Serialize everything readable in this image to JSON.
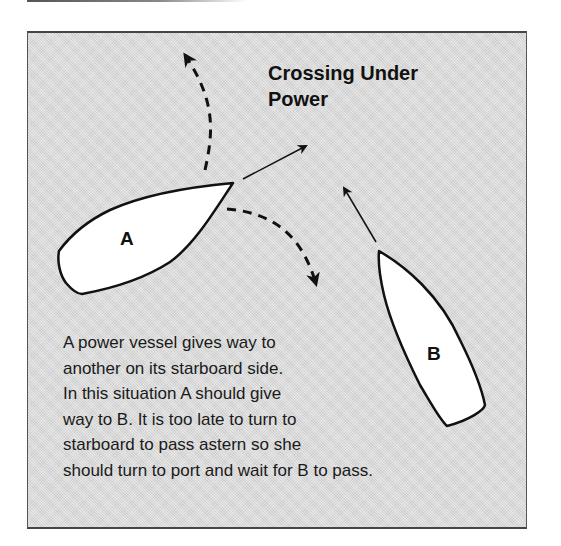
{
  "diagram": {
    "title_lines": [
      "Crossing Under",
      "Power"
    ],
    "caption_lines": [
      "A power vessel gives way to",
      "another on its starboard side.",
      "In this situation A should give",
      "way to B. It is too late to turn to",
      "starboard to pass astern so she",
      "should turn to port and wait for B to pass."
    ],
    "vessels": [
      {
        "id": "A",
        "label": "A",
        "heading": "north-east",
        "role": "give-way vessel"
      },
      {
        "id": "B",
        "label": "B",
        "heading": "north-west",
        "role": "stand-on vessel"
      }
    ],
    "arrows": [
      {
        "from": "A",
        "style": "solid",
        "meaning": "A course ahead"
      },
      {
        "from": "A",
        "style": "dashed",
        "meaning": "turn to port"
      },
      {
        "from": "A",
        "style": "dashed",
        "meaning": "turn to starboard"
      },
      {
        "from": "B",
        "style": "solid",
        "meaning": "B course ahead"
      }
    ],
    "colors": {
      "background": "#d9d9d9",
      "boat_fill": "#ffffff",
      "stroke": "#111111"
    }
  }
}
